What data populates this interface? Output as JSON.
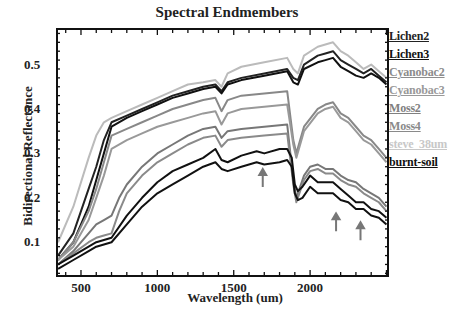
{
  "chart_data": {
    "type": "line",
    "title": "Spectral Endmembers",
    "xlabel": "Wavelength (um)",
    "ylabel": "Bidirectional Reflectance",
    "xlim": [
      343,
      2510
    ],
    "ylim": [
      0.024,
      0.58
    ],
    "xticks": [
      500,
      1000,
      1500,
      2000
    ],
    "yticks": [
      0.1,
      0.2,
      0.3,
      0.4,
      0.5
    ],
    "grid": false,
    "legend_position": "right-outside",
    "annotations": [
      {
        "type": "arrow",
        "x": 1690,
        "y_tip": 0.265,
        "label": ""
      },
      {
        "type": "arrow",
        "x": 2170,
        "y_tip": 0.165,
        "label": ""
      },
      {
        "type": "arrow",
        "x": 2330,
        "y_tip": 0.145,
        "label": ""
      }
    ],
    "series": [
      {
        "name": "Lichen2",
        "color": "#222222",
        "x": [
          350,
          450,
          550,
          600,
          650,
          700,
          800,
          900,
          1000,
          1100,
          1200,
          1300,
          1380,
          1420,
          1460,
          1550,
          1700,
          1850,
          1890,
          1920,
          1960,
          2050,
          2100,
          2150,
          2200,
          2250,
          2300,
          2350,
          2400,
          2450,
          2500
        ],
        "y": [
          0.07,
          0.12,
          0.22,
          0.27,
          0.33,
          0.37,
          0.385,
          0.4,
          0.415,
          0.43,
          0.44,
          0.45,
          0.455,
          0.44,
          0.46,
          0.47,
          0.48,
          0.49,
          0.47,
          0.465,
          0.5,
          0.52,
          0.525,
          0.53,
          0.51,
          0.5,
          0.49,
          0.48,
          0.49,
          0.475,
          0.46
        ]
      },
      {
        "name": "Lichen3",
        "color": "#111111",
        "x": [
          350,
          450,
          550,
          600,
          650,
          700,
          800,
          900,
          1000,
          1100,
          1200,
          1300,
          1380,
          1420,
          1460,
          1550,
          1700,
          1850,
          1890,
          1920,
          1960,
          2050,
          2100,
          2150,
          2200,
          2250,
          2300,
          2350,
          2400,
          2450,
          2500
        ],
        "y": [
          0.06,
          0.1,
          0.18,
          0.24,
          0.3,
          0.36,
          0.38,
          0.395,
          0.41,
          0.425,
          0.435,
          0.445,
          0.45,
          0.435,
          0.455,
          0.465,
          0.475,
          0.485,
          0.46,
          0.455,
          0.49,
          0.505,
          0.51,
          0.515,
          0.495,
          0.485,
          0.475,
          0.47,
          0.48,
          0.47,
          0.455
        ]
      },
      {
        "name": "Cyanobac2",
        "color": "#888888",
        "x": [
          350,
          450,
          550,
          600,
          650,
          700,
          800,
          900,
          1000,
          1100,
          1200,
          1300,
          1380,
          1420,
          1460,
          1550,
          1700,
          1850,
          1890,
          1910,
          1960,
          2050,
          2100,
          2150,
          2200,
          2250,
          2300,
          2350,
          2400,
          2450,
          2500
        ],
        "y": [
          0.06,
          0.1,
          0.17,
          0.22,
          0.28,
          0.34,
          0.355,
          0.37,
          0.385,
          0.4,
          0.41,
          0.42,
          0.425,
          0.395,
          0.42,
          0.43,
          0.435,
          0.44,
          0.33,
          0.3,
          0.36,
          0.4,
          0.41,
          0.415,
          0.39,
          0.38,
          0.36,
          0.34,
          0.33,
          0.31,
          0.29
        ]
      },
      {
        "name": "Cyanobac3",
        "color": "#999999",
        "x": [
          350,
          450,
          550,
          600,
          650,
          700,
          800,
          900,
          1000,
          1100,
          1200,
          1300,
          1380,
          1420,
          1460,
          1550,
          1700,
          1850,
          1890,
          1910,
          1960,
          2050,
          2100,
          2150,
          2200,
          2250,
          2300,
          2350,
          2400,
          2450,
          2500
        ],
        "y": [
          0.06,
          0.09,
          0.15,
          0.2,
          0.25,
          0.31,
          0.33,
          0.345,
          0.36,
          0.37,
          0.38,
          0.39,
          0.395,
          0.365,
          0.39,
          0.4,
          0.405,
          0.41,
          0.32,
          0.29,
          0.35,
          0.39,
          0.4,
          0.405,
          0.38,
          0.37,
          0.35,
          0.33,
          0.32,
          0.3,
          0.28
        ]
      },
      {
        "name": "Moss2",
        "color": "#777777",
        "x": [
          350,
          450,
          550,
          600,
          650,
          700,
          750,
          800,
          900,
          1000,
          1100,
          1200,
          1300,
          1380,
          1420,
          1460,
          1550,
          1700,
          1850,
          1890,
          1910,
          1960,
          2000,
          2050,
          2100,
          2150,
          2200,
          2250,
          2300,
          2350,
          2400,
          2450,
          2500
        ],
        "y": [
          0.05,
          0.08,
          0.12,
          0.14,
          0.15,
          0.16,
          0.2,
          0.23,
          0.27,
          0.3,
          0.32,
          0.34,
          0.355,
          0.36,
          0.335,
          0.35,
          0.355,
          0.36,
          0.365,
          0.24,
          0.2,
          0.25,
          0.27,
          0.275,
          0.265,
          0.265,
          0.25,
          0.24,
          0.235,
          0.22,
          0.21,
          0.2,
          0.18
        ]
      },
      {
        "name": "Moss4",
        "color": "#8a8a8a",
        "x": [
          350,
          450,
          550,
          600,
          650,
          700,
          750,
          800,
          900,
          1000,
          1100,
          1200,
          1300,
          1380,
          1420,
          1460,
          1550,
          1700,
          1850,
          1890,
          1910,
          1960,
          2000,
          2050,
          2100,
          2150,
          2200,
          2250,
          2300,
          2350,
          2400,
          2450,
          2500
        ],
        "y": [
          0.05,
          0.075,
          0.1,
          0.11,
          0.115,
          0.12,
          0.17,
          0.21,
          0.25,
          0.28,
          0.3,
          0.32,
          0.335,
          0.34,
          0.315,
          0.33,
          0.335,
          0.34,
          0.345,
          0.23,
          0.19,
          0.24,
          0.26,
          0.265,
          0.255,
          0.255,
          0.24,
          0.23,
          0.225,
          0.21,
          0.2,
          0.19,
          0.17
        ]
      },
      {
        "name": "steve_38um",
        "color": "#bbbbbb",
        "x": [
          350,
          450,
          550,
          600,
          650,
          700,
          800,
          900,
          1000,
          1100,
          1200,
          1300,
          1380,
          1420,
          1460,
          1550,
          1700,
          1850,
          1890,
          1920,
          1960,
          2050,
          2100,
          2150,
          2200,
          2250,
          2300,
          2350,
          2400,
          2450,
          2500
        ],
        "y": [
          0.1,
          0.18,
          0.29,
          0.34,
          0.37,
          0.38,
          0.395,
          0.41,
          0.425,
          0.44,
          0.455,
          0.46,
          0.465,
          0.45,
          0.48,
          0.495,
          0.505,
          0.515,
          0.49,
          0.48,
          0.52,
          0.54,
          0.545,
          0.55,
          0.53,
          0.52,
          0.505,
          0.49,
          0.5,
          0.485,
          0.47
        ]
      },
      {
        "name": "burnt-soil",
        "color": "#111111",
        "x": [
          350,
          450,
          550,
          600,
          650,
          700,
          800,
          900,
          1000,
          1100,
          1200,
          1300,
          1380,
          1420,
          1460,
          1550,
          1650,
          1700,
          1800,
          1850,
          1880,
          1900,
          1920,
          1950,
          2000,
          2050,
          2100,
          2150,
          2200,
          2250,
          2300,
          2350,
          2400,
          2450,
          2500
        ],
        "y": [
          0.04,
          0.06,
          0.08,
          0.09,
          0.095,
          0.1,
          0.14,
          0.18,
          0.21,
          0.23,
          0.25,
          0.27,
          0.28,
          0.265,
          0.26,
          0.27,
          0.28,
          0.275,
          0.28,
          0.285,
          0.27,
          0.21,
          0.195,
          0.2,
          0.225,
          0.21,
          0.21,
          0.21,
          0.195,
          0.19,
          0.175,
          0.175,
          0.16,
          0.155,
          0.14
        ]
      },
      {
        "name": "burnt-soil-b",
        "color": "#111111",
        "x": [
          350,
          450,
          550,
          600,
          650,
          700,
          800,
          900,
          1000,
          1100,
          1200,
          1300,
          1380,
          1420,
          1460,
          1550,
          1650,
          1700,
          1800,
          1850,
          1880,
          1900,
          1920,
          1950,
          2000,
          2050,
          2100,
          2150,
          2200,
          2250,
          2300,
          2350,
          2400,
          2450,
          2500
        ],
        "y": [
          0.05,
          0.07,
          0.09,
          0.1,
          0.105,
          0.11,
          0.16,
          0.2,
          0.235,
          0.26,
          0.275,
          0.29,
          0.31,
          0.285,
          0.28,
          0.295,
          0.305,
          0.3,
          0.31,
          0.31,
          0.29,
          0.23,
          0.215,
          0.225,
          0.25,
          0.235,
          0.235,
          0.235,
          0.22,
          0.205,
          0.19,
          0.19,
          0.175,
          0.17,
          0.155
        ]
      }
    ]
  },
  "legend": [
    {
      "label": "Lichen2",
      "color": "#222222",
      "y": 37
    },
    {
      "label": "Lichen3",
      "color": "#111111",
      "y": 55
    },
    {
      "label": "Cyanobac2",
      "color": "#8c8c8c",
      "y": 73
    },
    {
      "label": "Cyanobac3",
      "color": "#999999",
      "y": 91
    },
    {
      "label": "Moss2",
      "color": "#808080",
      "y": 109
    },
    {
      "label": "Moss4",
      "color": "#8a8a8a",
      "y": 127
    },
    {
      "label": "steve_38um",
      "color": "#c8c8c8",
      "y": 145
    },
    {
      "label": "burnt-soil",
      "color": "#111111",
      "y": 163
    }
  ],
  "xtick_labels": [
    "500",
    "1000",
    "1500",
    "2000"
  ],
  "ytick_labels": [
    "0.1",
    "0.2",
    "0.3",
    "0.4",
    "0.5"
  ]
}
